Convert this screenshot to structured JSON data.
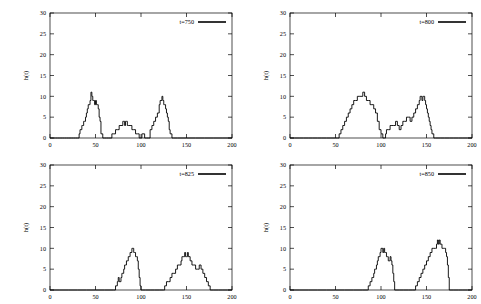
{
  "figure": {
    "layout": "2x2 grid of line plots",
    "panel_order": [
      "t=750",
      "t=800",
      "t=825",
      "t=850"
    ]
  },
  "axes": {
    "xlabel": "",
    "ylabel": "h(t)",
    "xticks": [
      0,
      50,
      100,
      150,
      200
    ],
    "yticks": [
      0,
      5,
      10,
      15,
      20,
      25,
      30
    ],
    "xlim": [
      0,
      200
    ],
    "ylim": [
      0,
      30
    ]
  },
  "colors": {
    "line": "#000000",
    "frame": "#000000",
    "background": "#ffffff"
  },
  "chart_data": [
    {
      "type": "line",
      "title": "",
      "legend": "t=750",
      "legend_position": "top-right",
      "xlabel": "",
      "ylabel": "h(t)",
      "xlim": [
        0,
        200
      ],
      "ylim": [
        0,
        30
      ],
      "xticks": [
        0,
        50,
        100,
        150,
        200
      ],
      "yticks": [
        0,
        5,
        10,
        15,
        20,
        25,
        30
      ],
      "grid": false,
      "x": [
        0,
        2,
        4,
        6,
        8,
        10,
        12,
        14,
        16,
        18,
        20,
        22,
        24,
        26,
        28,
        30,
        32,
        33,
        34,
        35,
        36,
        37,
        38,
        39,
        40,
        41,
        42,
        43,
        44,
        45,
        46,
        47,
        48,
        49,
        50,
        51,
        52,
        53,
        54,
        55,
        56,
        58,
        60,
        62,
        64,
        66,
        68,
        70,
        72,
        74,
        76,
        78,
        80,
        81,
        82,
        83,
        84,
        85,
        86,
        88,
        90,
        92,
        94,
        96,
        98,
        100,
        101,
        102,
        104,
        106,
        108,
        110,
        112,
        114,
        116,
        118,
        120,
        121,
        122,
        123,
        124,
        125,
        126,
        127,
        128,
        129,
        130,
        131,
        132,
        134,
        136,
        140,
        150,
        160,
        170,
        180,
        190,
        200
      ],
      "y": [
        0,
        0,
        0,
        0,
        0,
        0,
        0,
        0,
        0,
        0,
        0,
        0,
        0,
        0,
        0,
        0,
        1,
        2,
        2,
        3,
        3,
        4,
        4,
        5,
        6,
        7,
        8,
        8,
        9,
        11,
        10,
        9,
        9,
        8,
        9,
        8,
        8,
        7,
        5,
        4,
        1,
        0,
        0,
        0,
        0,
        0,
        1,
        1,
        2,
        2,
        3,
        3,
        4,
        4,
        3,
        4,
        4,
        3,
        3,
        3,
        2,
        2,
        1,
        1,
        0,
        0,
        1,
        1,
        0,
        0,
        0,
        2,
        3,
        4,
        5,
        6,
        8,
        9,
        9,
        10,
        9,
        8,
        8,
        7,
        6,
        5,
        4,
        2,
        1,
        0,
        0,
        0,
        0,
        0,
        0,
        0,
        0,
        0
      ]
    },
    {
      "type": "line",
      "title": "",
      "legend": "t=800",
      "legend_position": "top-right",
      "xlabel": "",
      "ylabel": "h(t)",
      "xlim": [
        0,
        200
      ],
      "ylim": [
        0,
        30
      ],
      "xticks": [
        0,
        50,
        100,
        150,
        200
      ],
      "yticks": [
        0,
        5,
        10,
        15,
        20,
        25,
        30
      ],
      "grid": false,
      "x": [
        0,
        5,
        10,
        15,
        20,
        25,
        30,
        35,
        40,
        45,
        50,
        52,
        54,
        56,
        58,
        60,
        62,
        64,
        66,
        68,
        70,
        72,
        74,
        76,
        78,
        80,
        82,
        84,
        86,
        88,
        90,
        92,
        94,
        96,
        98,
        100,
        102,
        104,
        105,
        106,
        108,
        110,
        112,
        114,
        116,
        118,
        120,
        122,
        124,
        126,
        128,
        130,
        132,
        134,
        136,
        138,
        140,
        142,
        143,
        144,
        145,
        146,
        147,
        148,
        149,
        150,
        151,
        152,
        153,
        154,
        155,
        156,
        158,
        160,
        165,
        170,
        175,
        180,
        185,
        190,
        195,
        200
      ],
      "y": [
        0,
        0,
        0,
        0,
        0,
        0,
        0,
        0,
        0,
        0,
        0,
        0,
        1,
        2,
        3,
        4,
        5,
        6,
        7,
        8,
        9,
        9,
        10,
        10,
        10,
        11,
        10,
        9,
        9,
        8,
        8,
        7,
        6,
        4,
        2,
        1,
        0,
        0,
        1,
        2,
        2,
        3,
        3,
        3,
        4,
        3,
        2,
        3,
        4,
        4,
        5,
        5,
        4,
        5,
        6,
        7,
        8,
        9,
        10,
        10,
        9,
        10,
        10,
        9,
        8,
        7,
        6,
        5,
        4,
        3,
        2,
        1,
        0,
        0,
        0,
        0,
        0,
        0,
        0,
        0,
        0,
        0
      ]
    },
    {
      "type": "line",
      "title": "",
      "legend": "t=825",
      "legend_position": "top-right",
      "xlabel": "",
      "ylabel": "h(t)",
      "xlim": [
        0,
        200
      ],
      "ylim": [
        0,
        30
      ],
      "xticks": [
        0,
        50,
        100,
        150,
        200
      ],
      "yticks": [
        0,
        5,
        10,
        15,
        20,
        25,
        30
      ],
      "grid": false,
      "x": [
        0,
        10,
        20,
        30,
        40,
        50,
        60,
        70,
        72,
        74,
        75,
        76,
        77,
        78,
        79,
        80,
        81,
        82,
        83,
        84,
        85,
        86,
        87,
        88,
        89,
        90,
        91,
        92,
        93,
        94,
        95,
        96,
        97,
        98,
        99,
        100,
        102,
        105,
        110,
        115,
        120,
        125,
        126,
        128,
        130,
        132,
        134,
        136,
        138,
        140,
        142,
        144,
        145,
        146,
        147,
        148,
        149,
        150,
        151,
        152,
        154,
        156,
        158,
        160,
        162,
        164,
        166,
        168,
        170,
        172,
        174,
        176,
        180,
        185,
        190,
        195,
        200
      ],
      "y": [
        0,
        0,
        0,
        0,
        0,
        0,
        0,
        0,
        1,
        2,
        3,
        2,
        2,
        3,
        4,
        4,
        5,
        6,
        6,
        7,
        7,
        8,
        8,
        9,
        9,
        10,
        10,
        9,
        9,
        8,
        8,
        7,
        5,
        3,
        1,
        0,
        0,
        0,
        0,
        0,
        0,
        0,
        1,
        2,
        2,
        3,
        4,
        4,
        5,
        6,
        6,
        7,
        8,
        8,
        8,
        9,
        8,
        8,
        9,
        8,
        7,
        6,
        6,
        5,
        5,
        6,
        5,
        4,
        3,
        2,
        1,
        0,
        0,
        0,
        0,
        0,
        0
      ]
    },
    {
      "type": "line",
      "title": "",
      "legend": "t=850",
      "legend_position": "top-right",
      "xlabel": "",
      "ylabel": "h(t)",
      "xlim": [
        0,
        200
      ],
      "ylim": [
        0,
        30
      ],
      "xticks": [
        0,
        50,
        100,
        150,
        200
      ],
      "yticks": [
        0,
        5,
        10,
        15,
        20,
        25,
        30
      ],
      "grid": false,
      "x": [
        0,
        10,
        20,
        30,
        40,
        50,
        60,
        70,
        80,
        85,
        86,
        87,
        88,
        89,
        90,
        91,
        92,
        93,
        94,
        95,
        96,
        97,
        98,
        99,
        100,
        101,
        102,
        103,
        104,
        105,
        106,
        107,
        108,
        109,
        110,
        111,
        112,
        113,
        114,
        115,
        120,
        125,
        130,
        135,
        138,
        140,
        142,
        144,
        146,
        148,
        150,
        152,
        154,
        156,
        158,
        160,
        161,
        162,
        163,
        164,
        165,
        166,
        167,
        168,
        169,
        170,
        171,
        172,
        173,
        174,
        175,
        180,
        185,
        190,
        195,
        200
      ],
      "y": [
        0,
        0,
        0,
        0,
        0,
        0,
        0,
        0,
        0,
        0,
        1,
        1,
        2,
        2,
        3,
        3,
        4,
        5,
        5,
        6,
        7,
        8,
        8,
        9,
        10,
        10,
        9,
        10,
        9,
        9,
        8,
        8,
        7,
        7,
        8,
        7,
        6,
        4,
        2,
        0,
        0,
        0,
        0,
        0,
        1,
        2,
        3,
        4,
        5,
        6,
        7,
        8,
        9,
        10,
        10,
        10,
        11,
        12,
        11,
        12,
        11,
        11,
        10,
        10,
        10,
        10,
        9,
        8,
        6,
        3,
        0,
        0,
        0,
        0,
        0,
        0
      ]
    }
  ]
}
